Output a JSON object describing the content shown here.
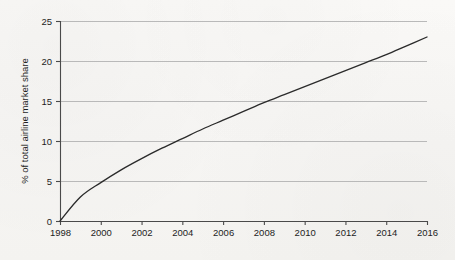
{
  "chart_data": {
    "type": "line",
    "title": "",
    "subtitle": "",
    "xlabel": "",
    "ylabel": "% of total airline market share",
    "xlim": [
      1998,
      2016
    ],
    "ylim": [
      0,
      25
    ],
    "grid": "horizontal",
    "legend": "none",
    "x_tick_labels": [
      "1998",
      "2000",
      "2002",
      "2004",
      "2006",
      "2008",
      "2010",
      "2012",
      "2014",
      "2016"
    ],
    "x_ticks": [
      1998,
      2000,
      2002,
      2004,
      2006,
      2008,
      2010,
      2012,
      2014,
      2016
    ],
    "y_tick_labels": [
      "0",
      "5",
      "10",
      "15",
      "20",
      "25"
    ],
    "y_ticks": [
      0,
      5,
      10,
      15,
      20,
      25
    ],
    "series": [
      {
        "name": "% of total airline market share",
        "color": "#2b2b2b",
        "x": [
          1998,
          1999,
          2000,
          2001,
          2002,
          2003,
          2004,
          2005,
          2006,
          2007,
          2008,
          2009,
          2010,
          2011,
          2012,
          2013,
          2014,
          2015,
          2016
        ],
        "values": [
          0.0,
          3.0,
          4.8,
          6.4,
          7.8,
          9.1,
          10.3,
          11.5,
          12.6,
          13.7,
          14.8,
          15.8,
          16.8,
          17.8,
          18.8,
          19.8,
          20.8,
          21.9,
          23.0
        ]
      }
    ],
    "annotations": [
      {
        "label": "curve crosses 5% near 2000",
        "x": 2000.4,
        "y": 5
      },
      {
        "label": "curve crosses 10% near 2004",
        "x": 2004.0,
        "y": 10
      },
      {
        "label": "curve crosses 15% near 2008",
        "x": 2008.1,
        "y": 15
      },
      {
        "label": "curve crosses 20% near 2013",
        "x": 2013.0,
        "y": 20
      },
      {
        "label": "endpoint at 2016",
        "x": 2016,
        "y": 23.0
      }
    ]
  },
  "style": {
    "background": "#f8f7f5",
    "grid_color": "#b9b9b9",
    "axis_color": "#4a4a4a",
    "line_color": "#2b2b2b",
    "text_color": "#1d1d1d"
  },
  "geometry": {
    "plot_left": 60,
    "plot_right": 427,
    "plot_top": 21,
    "plot_bottom": 221
  }
}
